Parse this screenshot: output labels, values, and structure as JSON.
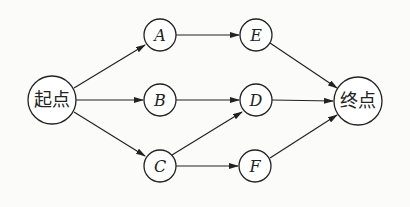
{
  "diagram": {
    "type": "directed-graph",
    "nodes": {
      "start": {
        "label": "起点"
      },
      "A": {
        "label": "A"
      },
      "B": {
        "label": "B"
      },
      "C": {
        "label": "C"
      },
      "D": {
        "label": "D"
      },
      "E": {
        "label": "E"
      },
      "F": {
        "label": "F"
      },
      "end": {
        "label": "终点"
      }
    },
    "edges": [
      {
        "from": "起点",
        "to": "A"
      },
      {
        "from": "起点",
        "to": "B"
      },
      {
        "from": "起点",
        "to": "C"
      },
      {
        "from": "A",
        "to": "E"
      },
      {
        "from": "B",
        "to": "D"
      },
      {
        "from": "C",
        "to": "D"
      },
      {
        "from": "C",
        "to": "F"
      },
      {
        "from": "E",
        "to": "终点"
      },
      {
        "from": "D",
        "to": "终点"
      },
      {
        "from": "F",
        "to": "终点"
      }
    ],
    "colors": {
      "stroke": "#222222",
      "background": "#fbfbf9"
    }
  }
}
